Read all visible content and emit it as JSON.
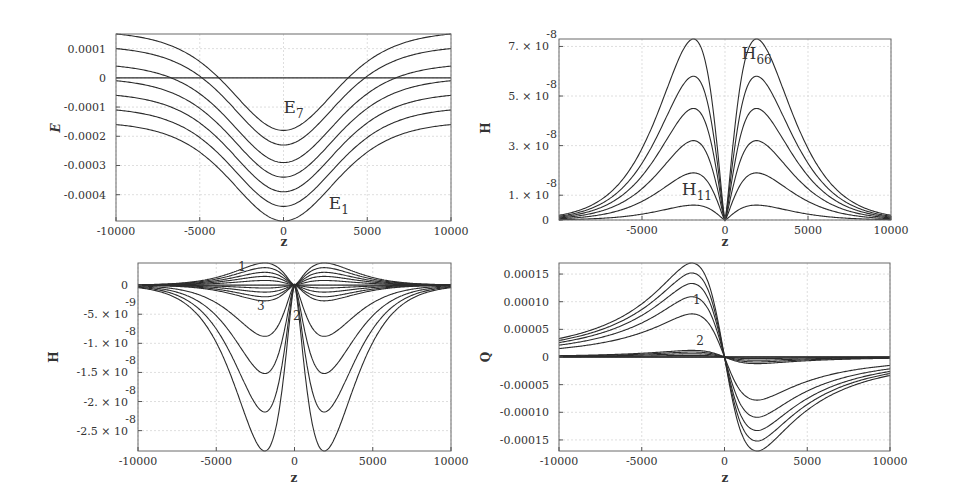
{
  "figure": {
    "background": "#ffffff",
    "curve_color": "#2c2c2c",
    "grid_color": "#d0d0d0"
  },
  "chart_data": [
    {
      "id": "panel-energy",
      "type": "line",
      "title": "",
      "xlabel": "z",
      "ylabel": "E",
      "xlim": [
        -10000,
        10000
      ],
      "ylim": [
        -0.00049,
        0.00015
      ],
      "xticks": [
        -10000,
        -5000,
        0,
        5000,
        10000
      ],
      "xtick_labels": [
        "-10000",
        "-5000",
        "0",
        "5000",
        "10000"
      ],
      "yticks": [
        0.0001,
        0,
        -0.0001,
        -0.0002,
        -0.0003,
        -0.0004
      ],
      "ytick_labels": [
        "0.0001",
        "0",
        "-0.0001",
        "-0.0002",
        "-0.0003",
        "-0.0004"
      ],
      "grid": true,
      "annotations": [
        {
          "text": "E",
          "sub": "7",
          "x": 0,
          "y": -0.00012
        },
        {
          "text": "E",
          "sub": "1",
          "x": 2700,
          "y": -0.00045
        }
      ],
      "series": [
        {
          "name": "E1",
          "at_z0": -0.00049,
          "at_edge": -0.00016
        },
        {
          "name": "E2",
          "at_z0": -0.00044,
          "at_edge": -0.00011
        },
        {
          "name": "E3",
          "at_z0": -0.00039,
          "at_edge": -6e-05
        },
        {
          "name": "E4",
          "at_z0": -0.00034,
          "at_edge": -1e-05
        },
        {
          "name": "E5",
          "at_z0": -0.00029,
          "at_edge": 4e-05
        },
        {
          "name": "E6",
          "at_z0": -0.00023,
          "at_edge": 0.0001
        },
        {
          "name": "E7",
          "at_z0": -0.00018,
          "at_edge": 0.00015
        },
        {
          "name": "zero",
          "at_z0": 0,
          "at_edge": 0
        }
      ]
    },
    {
      "id": "panel-h-diagonal",
      "type": "line",
      "title": "",
      "xlabel": "z",
      "ylabel": "H",
      "xlim": [
        -10000,
        10000
      ],
      "ylim": [
        0,
        7.3e-08
      ],
      "xticks": [
        -5000,
        0,
        5000,
        10000
      ],
      "xtick_labels": [
        "-5000",
        "0",
        "5000",
        "10000"
      ],
      "yticks": [
        7e-08,
        5e-08,
        3e-08,
        1e-08,
        0
      ],
      "ytick_labels": [
        "7. × 10",
        "5. × 10",
        "3. × 10",
        "1. × 10",
        "0"
      ],
      "ytick_exponent": "-8",
      "grid": true,
      "annotations": [
        {
          "text": "H",
          "sub": "66",
          "x": 1000,
          "y": 6.5e-08
        },
        {
          "text": "H",
          "sub": "11",
          "x": -2600,
          "y": 1e-08
        }
      ],
      "series": [
        {
          "name": "H11",
          "peak": 6e-09,
          "peak_z": 1900
        },
        {
          "name": "H22",
          "peak": 1.9e-08,
          "peak_z": 1900
        },
        {
          "name": "H33",
          "peak": 3.2e-08,
          "peak_z": 1900
        },
        {
          "name": "H44",
          "peak": 4.5e-08,
          "peak_z": 1900
        },
        {
          "name": "H55",
          "peak": 5.8e-08,
          "peak_z": 1900
        },
        {
          "name": "H66",
          "peak": 7.3e-08,
          "peak_z": 1900
        }
      ]
    },
    {
      "id": "panel-h-offdiagonal",
      "type": "line",
      "title": "",
      "xlabel": "z",
      "ylabel": "H",
      "xlim": [
        -10000,
        10000
      ],
      "ylim": [
        -2.85e-08,
        3.8e-09
      ],
      "xticks": [
        -10000,
        -5000,
        0,
        5000,
        10000
      ],
      "xtick_labels": [
        "-10000",
        "-5000",
        "0",
        "5000",
        "10000"
      ],
      "yticks": [
        0,
        -5e-09,
        -1e-08,
        -1.5e-08,
        -2e-08,
        -2.5e-08
      ],
      "ytick_labels": [
        "0",
        "-5. × 10",
        "-1. × 10",
        "-1.5 × 10",
        "-2. × 10",
        "-2.5 × 10"
      ],
      "ytick_exponents": [
        "",
        "-9",
        "-8",
        "-8",
        "-8",
        "-8"
      ],
      "grid": true,
      "annotations": [
        {
          "text": "1",
          "x": -3600,
          "y": 2.5e-09
        },
        {
          "text": "3",
          "x": -2400,
          "y": -4.2e-09
        },
        {
          "text": "2",
          "x": -100,
          "y": -6e-09
        }
      ],
      "series": [
        {
          "name": "group1",
          "peaks": [
            3.8e-09,
            3e-09,
            2.2e-09,
            1.5e-09,
            8e-10
          ]
        },
        {
          "name": "group3",
          "peaks": [
            -5e-10,
            -1.2e-09,
            -2e-09,
            -2.7e-09
          ]
        },
        {
          "name": "group2",
          "peaks": [
            -8.8e-09,
            -1.52e-08,
            -2.18e-08,
            -2.85e-08
          ]
        }
      ]
    },
    {
      "id": "panel-q",
      "type": "line",
      "title": "",
      "xlabel": "z",
      "ylabel": "Q",
      "xlim": [
        -10000,
        10000
      ],
      "ylim": [
        -0.00017,
        0.00017
      ],
      "xticks": [
        -10000,
        -5000,
        0,
        5000,
        10000
      ],
      "xtick_labels": [
        "-10000",
        "-5000",
        "0",
        "5000",
        "10000"
      ],
      "yticks": [
        0.00015,
        0.0001,
        5e-05,
        0,
        -5e-05,
        -0.0001,
        -0.00015
      ],
      "ytick_labels": [
        "0.00015",
        "0.00010",
        "0.00005",
        "0",
        "-0.00005",
        "-0.00010",
        "-0.00015"
      ],
      "grid": true,
      "annotations": [
        {
          "text": "1",
          "x": -1900,
          "y": 9.5e-05
        },
        {
          "text": "2",
          "x": -1700,
          "y": 2.2e-05
        }
      ],
      "series": [
        {
          "name": "group1",
          "peaks": [
            7.8e-05,
            0.000109,
            0.000133,
            0.000152,
            0.00017
          ]
        },
        {
          "name": "group2",
          "peaks": [
            1.2e-05,
            9e-06,
            6e-06,
            3e-06,
            0.0
          ]
        }
      ]
    }
  ]
}
